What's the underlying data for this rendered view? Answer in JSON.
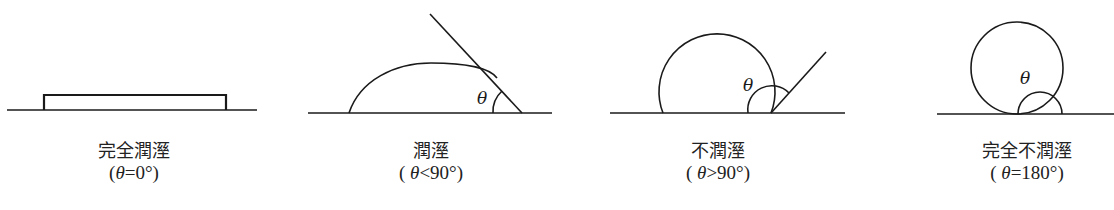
{
  "figures": [
    {
      "id": "complete-wetting",
      "label": "完全潤溼",
      "condition_prefix": "(",
      "symbol": "θ",
      "condition_rest": "=0°)",
      "angle_deg": 0
    },
    {
      "id": "wetting",
      "label": "潤溼",
      "condition_prefix": "( ",
      "symbol": "θ",
      "condition_rest": "<90°)",
      "angle_deg": "<90"
    },
    {
      "id": "non-wetting",
      "label": "不潤溼",
      "condition_prefix": "( ",
      "symbol": "θ",
      "condition_rest": ">90°)",
      "angle_deg": ">90"
    },
    {
      "id": "complete-non-wetting",
      "label": "完全不潤溼",
      "condition_prefix": "( ",
      "symbol": "θ",
      "condition_rest": "=180°)",
      "angle_deg": 180
    }
  ],
  "angle_symbol": "θ",
  "colors": {
    "line": "#1a1a1a",
    "text": "#222222",
    "background": "#ffffff"
  }
}
